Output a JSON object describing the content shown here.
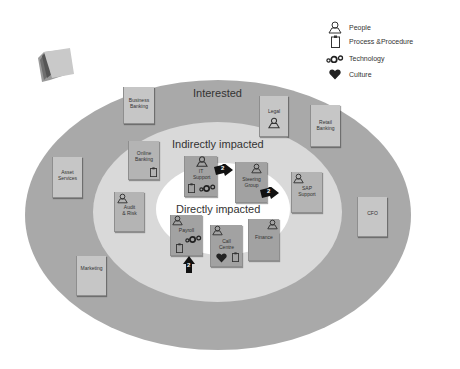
{
  "legend": {
    "items": [
      {
        "icon": "people-icon",
        "label": "People"
      },
      {
        "icon": "clipboard-icon",
        "label": "Process &Procedure"
      },
      {
        "icon": "gears-icon",
        "label": "Technology"
      },
      {
        "icon": "heart-icon",
        "label": "Culture"
      }
    ]
  },
  "zones": {
    "outer": "Interested",
    "middle": "Indirectly impacted",
    "inner": "Directly impacted"
  },
  "colors": {
    "outer_ring": "#a9a9a9",
    "middle_ring": "#d9d9d9",
    "inner_ring": "#ffffff",
    "sticky_note": "#b4b4b4",
    "icon": "#222222"
  },
  "notes": {
    "business_banking": "Business Banking",
    "legal": "Legal",
    "retail_banking": "Retail Banking",
    "asset_services": "Asset Services",
    "cfo": "CFO",
    "marketing": "Marketing",
    "online_banking": "Online Banking",
    "audit_risk": "Audit & Risk",
    "it_support": "IT Support",
    "steering_group": "Steering Group",
    "sap_support": "SAP Support",
    "payroll": "Payroll",
    "call_centre": "Call Centre",
    "finance": "Finance"
  },
  "arrows": {
    "it_support": "2",
    "steering_group": "2",
    "payroll": "2"
  }
}
